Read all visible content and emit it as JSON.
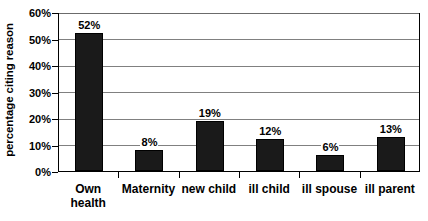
{
  "chart_data": {
    "type": "bar",
    "title": "",
    "xlabel": "",
    "ylabel": "percentage citing reason",
    "categories": [
      "Own health",
      "Maternity",
      "new child",
      "ill child",
      "ill spouse",
      "ill parent"
    ],
    "values": [
      52,
      8,
      19,
      12,
      6,
      13
    ],
    "value_labels": [
      "52%",
      "8%",
      "19%",
      "12%",
      "6%",
      "13%"
    ],
    "ylim": [
      0,
      60
    ],
    "ytick_labels": [
      "0%",
      "10%",
      "20%",
      "30%",
      "40%",
      "50%",
      "60%"
    ],
    "ytick_values": [
      0,
      10,
      20,
      30,
      40,
      50,
      60
    ],
    "grid": true,
    "legend": "none",
    "bar_color": "#1a1a1a",
    "gridline_color": "#808080",
    "axis_color": "#000000",
    "background": "#ffffff"
  }
}
